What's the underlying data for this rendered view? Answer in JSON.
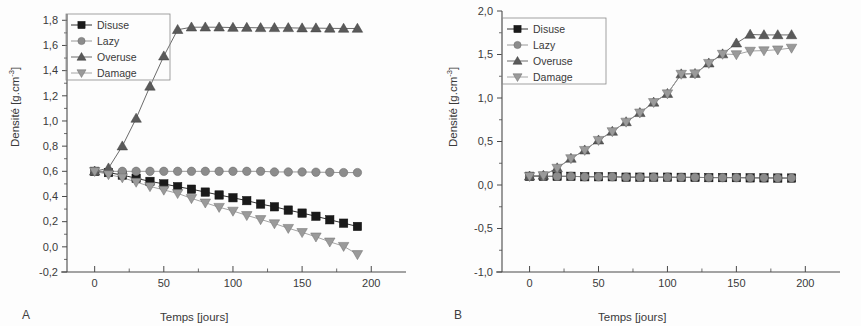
{
  "figure": {
    "panels": [
      {
        "letter": "A",
        "xlabel": "Temps [jours]",
        "ylabel_text": "Densité [g.cm",
        "ylabel_sup": "-3",
        "ylabel_close": "]"
      },
      {
        "letter": "B",
        "xlabel": "Temps [jours]",
        "ylabel_text": "Densité [g.cm",
        "ylabel_sup": "-3",
        "ylabel_close": "]"
      }
    ]
  },
  "colors": {
    "disuse": "#1a1a1a",
    "lazy": "#8c8c8c",
    "overuse": "#5a5a5a",
    "damage": "#9a9a9a",
    "axis": "#4a4a4a",
    "text": "#3a3a3a",
    "background": "#fdfdfd"
  },
  "chart_data": [
    {
      "type": "line",
      "panel": "A",
      "title": "",
      "xlabel": "Temps [jours]",
      "ylabel": "Densité [g.cm-3]",
      "xlim": [
        -20,
        215
      ],
      "ylim": [
        -0.2,
        1.85
      ],
      "xticks": [
        0,
        50,
        100,
        150,
        200
      ],
      "xticklabels": [
        "0",
        "50",
        "100",
        "150",
        "200"
      ],
      "yticks": [
        -0.2,
        0.0,
        0.2,
        0.4,
        0.6,
        0.8,
        1.0,
        1.2,
        1.4,
        1.6,
        1.8
      ],
      "yticklabels": [
        "-0,2",
        "0,0",
        "0,2",
        "0,4",
        "0,6",
        "0,8",
        "1,0",
        "1,2",
        "1,4",
        "1,6",
        "1,8"
      ],
      "x": [
        0,
        10,
        20,
        30,
        40,
        50,
        60,
        70,
        80,
        90,
        100,
        110,
        120,
        130,
        140,
        150,
        160,
        170,
        180,
        190
      ],
      "grid": false,
      "legend_position": "upper left",
      "series": [
        {
          "name": "Disuse",
          "marker": "square",
          "color": "#1a1a1a",
          "values": [
            0.6,
            0.59,
            0.57,
            0.545,
            0.52,
            0.5,
            0.478,
            0.458,
            0.435,
            0.412,
            0.39,
            0.367,
            0.34,
            0.318,
            0.292,
            0.268,
            0.243,
            0.215,
            0.188,
            0.162
          ]
        },
        {
          "name": "Lazy",
          "marker": "circle",
          "color": "#8c8c8c",
          "values": [
            0.6,
            0.6,
            0.6,
            0.6,
            0.6,
            0.6,
            0.6,
            0.6,
            0.6,
            0.6,
            0.6,
            0.6,
            0.6,
            0.595,
            0.595,
            0.595,
            0.593,
            0.592,
            0.59,
            0.59
          ]
        },
        {
          "name": "Overuse",
          "marker": "triangle-up",
          "color": "#5a5a5a",
          "values": [
            0.6,
            0.625,
            0.8,
            1.02,
            1.275,
            1.515,
            1.725,
            1.745,
            1.745,
            1.745,
            1.742,
            1.742,
            1.74,
            1.74,
            1.74,
            1.738,
            1.738,
            1.736,
            1.735,
            1.735
          ]
        },
        {
          "name": "Damage",
          "marker": "triangle-down",
          "color": "#9a9a9a",
          "values": [
            0.6,
            0.575,
            0.55,
            0.515,
            0.48,
            0.452,
            0.425,
            0.385,
            0.35,
            0.315,
            0.285,
            0.25,
            0.218,
            0.185,
            0.148,
            0.115,
            0.08,
            0.04,
            0.005,
            -0.06
          ]
        }
      ]
    },
    {
      "type": "line",
      "panel": "B",
      "title": "",
      "xlabel": "Temps [jours]",
      "ylabel": "Densité [g.cm-3]",
      "xlim": [
        -20,
        215
      ],
      "ylim": [
        -1.0,
        2.0
      ],
      "xticks": [
        0,
        50,
        100,
        150,
        200
      ],
      "xticklabels": [
        "0",
        "50",
        "100",
        "150",
        "200"
      ],
      "yticks": [
        -1.0,
        -0.5,
        0.0,
        0.5,
        1.0,
        1.5,
        2.0
      ],
      "yticklabels": [
        "-1,0",
        "-0,5",
        "0,0",
        "0,5",
        "1,0",
        "1,5",
        "2,0"
      ],
      "x": [
        0,
        10,
        20,
        30,
        40,
        50,
        60,
        70,
        80,
        90,
        100,
        110,
        120,
        130,
        140,
        150,
        160,
        170,
        180,
        190
      ],
      "grid": false,
      "legend_position": "upper left",
      "series": [
        {
          "name": "Disuse",
          "marker": "square",
          "color": "#1a1a1a",
          "values": [
            0.1,
            0.1,
            0.1,
            0.1,
            0.095,
            0.095,
            0.095,
            0.09,
            0.09,
            0.09,
            0.09,
            0.088,
            0.088,
            0.085,
            0.085,
            0.085,
            0.082,
            0.082,
            0.08,
            0.08
          ]
        },
        {
          "name": "Lazy",
          "marker": "circle",
          "color": "#8c8c8c",
          "values": [
            0.1,
            0.1,
            0.1,
            0.1,
            0.095,
            0.095,
            0.095,
            0.09,
            0.09,
            0.09,
            0.09,
            0.088,
            0.088,
            0.085,
            0.085,
            0.085,
            0.082,
            0.082,
            0.08,
            0.08
          ]
        },
        {
          "name": "Overuse",
          "marker": "triangle-up",
          "color": "#5a5a5a",
          "values": [
            0.1,
            0.11,
            0.195,
            0.305,
            0.4,
            0.515,
            0.615,
            0.725,
            0.83,
            0.95,
            1.05,
            1.275,
            1.28,
            1.4,
            1.505,
            1.63,
            1.73,
            1.725,
            1.725,
            1.725
          ]
        },
        {
          "name": "Damage",
          "marker": "triangle-down",
          "color": "#9a9a9a",
          "values": [
            0.1,
            0.11,
            0.195,
            0.305,
            0.4,
            0.515,
            0.615,
            0.725,
            0.83,
            0.95,
            1.05,
            1.275,
            1.28,
            1.4,
            1.505,
            1.5,
            1.54,
            1.545,
            1.555,
            1.575
          ]
        }
      ]
    }
  ],
  "legend": {
    "entries": [
      {
        "label": "Disuse",
        "marker": "square",
        "color": "#1a1a1a"
      },
      {
        "label": "Lazy",
        "marker": "circle",
        "color": "#8c8c8c"
      },
      {
        "label": "Overuse",
        "marker": "triangle-up",
        "color": "#5a5a5a"
      },
      {
        "label": "Damage",
        "marker": "triangle-down",
        "color": "#9a9a9a"
      }
    ]
  }
}
